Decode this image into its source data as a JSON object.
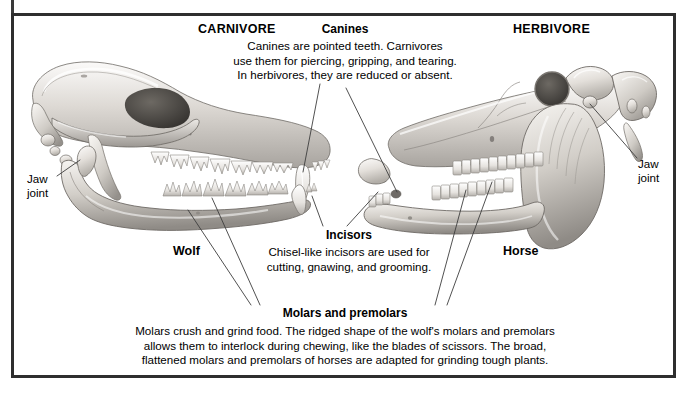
{
  "figure": {
    "headers": {
      "carnivore": "CARNIVORE",
      "herbivore": "HERBIVORE"
    },
    "specimens": {
      "left": "Wolf",
      "right": "Horse"
    },
    "joint_labels": {
      "left": "Jaw\njoint",
      "right": "Jaw\njoint"
    },
    "callouts": {
      "canines": {
        "title": "Canines",
        "body": "Canines are pointed teeth. Carnivores\nuse them for piercing, gripping, and tearing.\nIn herbivores, they are reduced or absent."
      },
      "incisors": {
        "title": "Incisors",
        "body": "Chisel-like incisors are used for\ncutting, gnawing, and grooming."
      },
      "molars": {
        "title": "Molars and premolars",
        "body": "Molars crush and grind food. The ridged shape of the wolf's molars and premolars\nallows them to interlock during chewing, like the blades of scissors. The broad,\nflattened molars and premolars of horses are adapted for grinding tough plants."
      }
    },
    "colors": {
      "border": "#2e2e2e",
      "text": "#000000",
      "background": "#ffffff",
      "bone_light": "#f2f0ed",
      "bone_mid": "#cdc9c4",
      "bone_shadow": "#8d8984",
      "cavity_dark": "#4a4743",
      "leader_line": "#3d3d3d"
    },
    "illustrations": [
      {
        "name": "wolf-skull",
        "side": "left",
        "type": "carnivore-skull-lateral"
      },
      {
        "name": "horse-skull",
        "side": "right",
        "type": "herbivore-skull-lateral"
      }
    ]
  }
}
